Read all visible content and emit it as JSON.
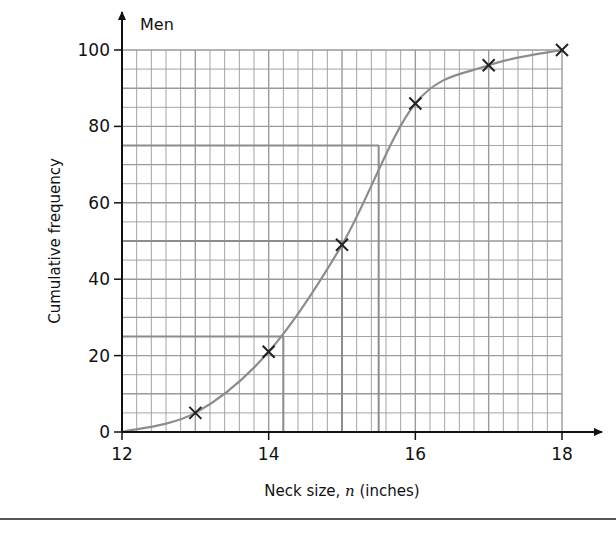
{
  "chart_data": {
    "type": "line",
    "title": "",
    "series_label": "Men",
    "xlabel": "Neck size, n (inches)",
    "xlabel_parts": {
      "before": "Neck size, ",
      "var": "n",
      "after": " (inches)"
    },
    "ylabel": "Cumulative frequency",
    "xlim": [
      12,
      18
    ],
    "ylim": [
      0,
      100
    ],
    "x_ticks": [
      12,
      14,
      16,
      18
    ],
    "y_ticks": [
      0,
      20,
      40,
      60,
      80,
      100
    ],
    "grid": {
      "on": true,
      "x_minor_step": 0.2,
      "y_minor_step": 5,
      "x_major_step": 1,
      "y_major_step": 10
    },
    "series": [
      {
        "name": "Men",
        "marker": "x",
        "smooth": true,
        "points": [
          {
            "x": 12,
            "y": 0
          },
          {
            "x": 13,
            "y": 5
          },
          {
            "x": 14,
            "y": 21
          },
          {
            "x": 15,
            "y": 49
          },
          {
            "x": 16,
            "y": 86
          },
          {
            "x": 17,
            "y": 96
          },
          {
            "x": 18,
            "y": 100
          }
        ],
        "plotted_markers": [
          13,
          14,
          15,
          16,
          17,
          18
        ]
      }
    ],
    "reading_lines": [
      {
        "label": "lower quartile",
        "y": 25,
        "x": 14.2
      },
      {
        "label": "median",
        "y": 50,
        "x": 15.0
      },
      {
        "label": "upper quartile",
        "y": 75,
        "x": 15.5
      }
    ],
    "colors": {
      "axis": "#111111",
      "grid": "#9a9a9a",
      "curve": "#8c8c8c",
      "marker": "#222222",
      "reading_line": "#8c8c8c"
    }
  }
}
